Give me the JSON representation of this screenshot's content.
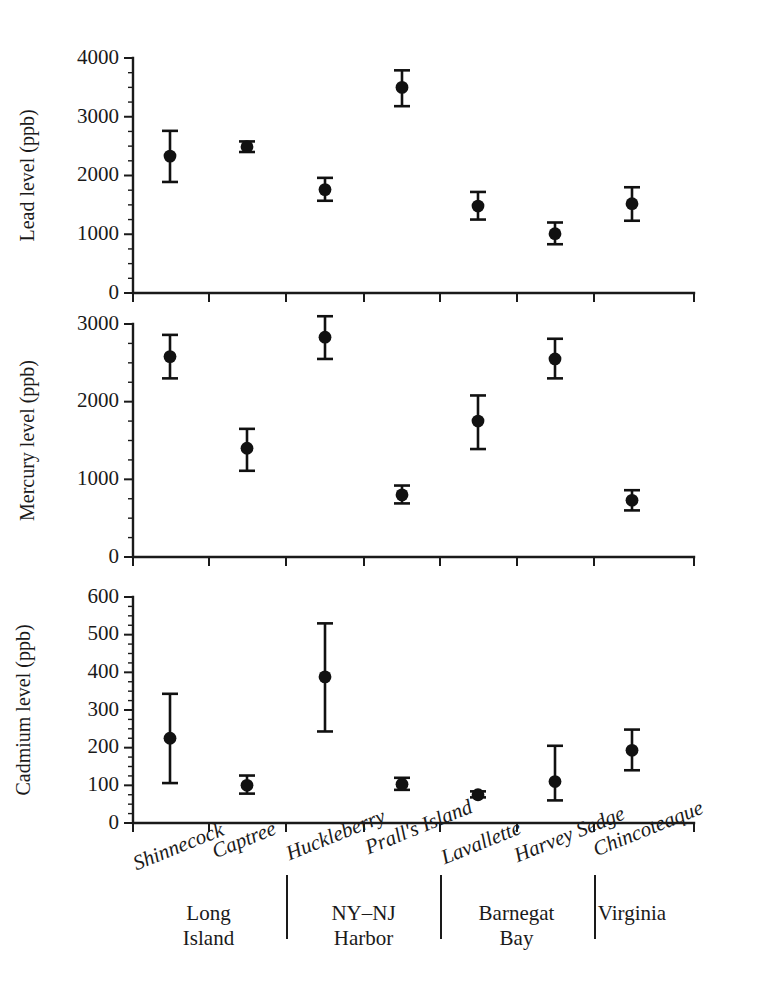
{
  "figure": {
    "width": 774,
    "height": 991,
    "background": "#ffffff",
    "ink_color": "#1a1a1a",
    "marker_color": "#111111"
  },
  "sites": [
    "Shinnecock",
    "Captree",
    "Huckleberry",
    "Prall's Island",
    "Lavallette",
    "Harvey Sedge",
    "Chincoteaque"
  ],
  "regions": [
    {
      "line1": "Long",
      "line2": "Island"
    },
    {
      "line1": "NY–NJ",
      "line2": "Harbor"
    },
    {
      "line1": "Barnegat",
      "line2": "Bay"
    },
    {
      "line1": "Virginia",
      "line2": ""
    }
  ],
  "chart_data": [
    {
      "type": "scatter",
      "panel": "lead",
      "title": "",
      "ylabel": "Lead level (ppb)",
      "xlabel": "",
      "ylim": [
        0,
        4000
      ],
      "yticks": [
        0,
        1000,
        2000,
        3000,
        4000
      ],
      "ytick_labels": [
        "0",
        "1000",
        "2000",
        "3000",
        "4000"
      ],
      "minor_tick_step": 250,
      "grid": false,
      "legend": "none",
      "categories": [
        "Shinnecock",
        "Captree",
        "Huckleberry",
        "Prall's Island",
        "Lavallette",
        "Harvey Sedge",
        "Chincoteaque"
      ],
      "values": [
        2330,
        2490,
        1760,
        3500,
        1480,
        1010,
        1520
      ],
      "err_low": [
        1890,
        2400,
        1570,
        3180,
        1250,
        830,
        1230
      ],
      "err_high": [
        2760,
        2580,
        1960,
        3790,
        1720,
        1200,
        1800
      ]
    },
    {
      "type": "scatter",
      "panel": "mercury",
      "title": "",
      "ylabel": "Mercury level (ppb)",
      "xlabel": "",
      "ylim": [
        0,
        3000
      ],
      "yticks": [
        0,
        1000,
        2000,
        3000
      ],
      "ytick_labels": [
        "0",
        "1000",
        "2000",
        "3000"
      ],
      "minor_tick_step": 250,
      "grid": false,
      "legend": "none",
      "categories": [
        "Shinnecock",
        "Captree",
        "Huckleberry",
        "Prall's Island",
        "Lavallette",
        "Harvey Sedge",
        "Chincoteaque"
      ],
      "values": [
        2580,
        1400,
        2830,
        800,
        1750,
        2550,
        730
      ],
      "err_low": [
        2300,
        1110,
        2550,
        690,
        1390,
        2300,
        600
      ],
      "err_high": [
        2860,
        1650,
        3100,
        920,
        2080,
        2810,
        860
      ]
    },
    {
      "type": "scatter",
      "panel": "cadmium",
      "title": "",
      "ylabel": "Cadmium level (ppb)",
      "xlabel": "",
      "ylim": [
        0,
        600
      ],
      "yticks": [
        0,
        100,
        200,
        300,
        400,
        500,
        600
      ],
      "ytick_labels": [
        "0",
        "100",
        "200",
        "300",
        "400",
        "500",
        "600"
      ],
      "minor_tick_step": 25,
      "grid": false,
      "legend": "none",
      "categories": [
        "Shinnecock",
        "Captree",
        "Huckleberry",
        "Prall's Island",
        "Lavallette",
        "Harvey Sedge",
        "Chincoteaque"
      ],
      "values": [
        225,
        100,
        388,
        103,
        75,
        110,
        193
      ],
      "err_low": [
        106,
        78,
        243,
        88,
        68,
        60,
        140
      ],
      "err_high": [
        343,
        126,
        530,
        120,
        84,
        205,
        248
      ]
    }
  ]
}
